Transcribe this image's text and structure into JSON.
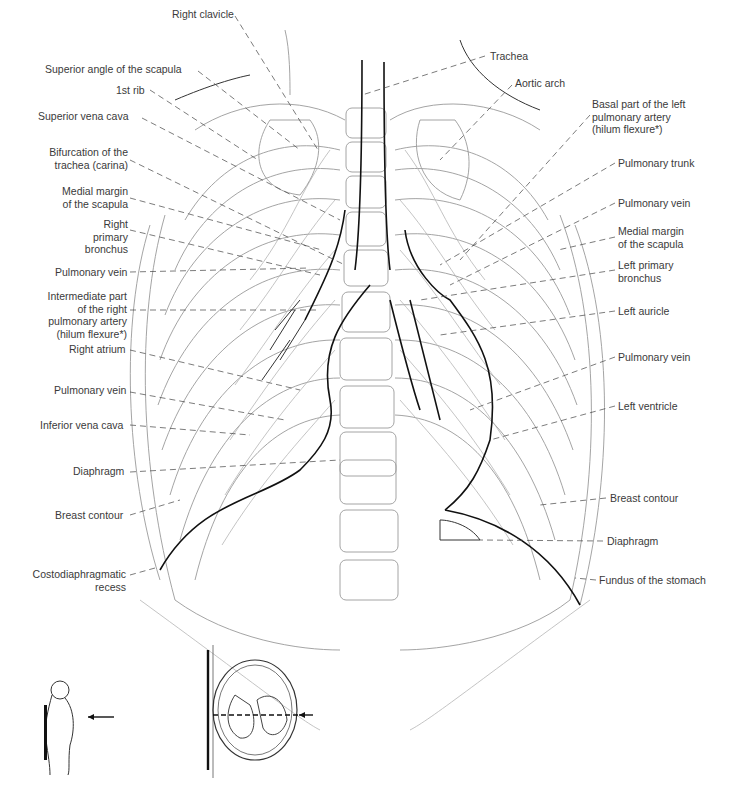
{
  "figure": {
    "labels_left": [
      {
        "id": "right-clavicle",
        "text": "Right clavicle",
        "x": 172,
        "y": 8
      },
      {
        "id": "superior-angle-scapula",
        "text": "Superior angle of the scapula",
        "x": 45,
        "y": 63
      },
      {
        "id": "first-rib",
        "text": "1st rib",
        "x": 116,
        "y": 84
      },
      {
        "id": "superior-vena-cava",
        "text": "Superior vena cava",
        "x": 38,
        "y": 110
      },
      {
        "id": "carina",
        "text": "Bifurcation of the\ntrachea (carina)",
        "x": 48,
        "y": 146
      },
      {
        "id": "medial-margin-scapula-right",
        "text": "Medial margin\nof the scapula",
        "x": 62,
        "y": 185
      },
      {
        "id": "right-primary-bronchus",
        "text": "Right primary\nbronchus",
        "x": 66,
        "y": 218
      },
      {
        "id": "pulmonary-vein-right-upper",
        "text": "Pulmonary vein",
        "x": 55,
        "y": 266
      },
      {
        "id": "intermediate-pa",
        "text": "Intermediate part\nof the right\npulmonary artery\n(hilum flexure*)",
        "x": 47,
        "y": 290
      },
      {
        "id": "right-atrium",
        "text": "Right atrium",
        "x": 69,
        "y": 343
      },
      {
        "id": "pulmonary-vein-right-lower",
        "text": "Pulmonary vein",
        "x": 54,
        "y": 384
      },
      {
        "id": "inferior-vena-cava",
        "text": "Inferior vena cava",
        "x": 40,
        "y": 419
      },
      {
        "id": "diaphragm-right",
        "text": "Diaphragm",
        "x": 73,
        "y": 465
      },
      {
        "id": "breast-contour-right",
        "text": "Breast contour",
        "x": 55,
        "y": 509
      },
      {
        "id": "costodiaphragmatic-recess",
        "text": "Costodiaphragmatic\nrecess",
        "x": 30,
        "y": 568
      }
    ],
    "labels_right": [
      {
        "id": "trachea",
        "text": "Trachea",
        "x": 490,
        "y": 50
      },
      {
        "id": "aortic-arch",
        "text": "Aortic arch",
        "x": 515,
        "y": 77
      },
      {
        "id": "basal-left-pa",
        "text": "Basal part of the left\npulmonary artery\n(hilum flexure*)",
        "x": 592,
        "y": 98
      },
      {
        "id": "pulmonary-trunk",
        "text": "Pulmonary trunk",
        "x": 618,
        "y": 157
      },
      {
        "id": "pulmonary-vein-left-upper",
        "text": "Pulmonary vein",
        "x": 618,
        "y": 197
      },
      {
        "id": "medial-margin-scapula-left",
        "text": "Medial margin\nof the scapula",
        "x": 618,
        "y": 225
      },
      {
        "id": "left-primary-bronchus",
        "text": "Left primary\nbronchus",
        "x": 618,
        "y": 259
      },
      {
        "id": "left-auricle",
        "text": "Left auricle",
        "x": 618,
        "y": 305
      },
      {
        "id": "pulmonary-vein-left-lower",
        "text": "Pulmonary vein",
        "x": 618,
        "y": 351
      },
      {
        "id": "left-ventricle",
        "text": "Left ventricle",
        "x": 618,
        "y": 400
      },
      {
        "id": "breast-contour-left",
        "text": "Breast contour",
        "x": 610,
        "y": 492
      },
      {
        "id": "diaphragm-left",
        "text": "Diaphragm",
        "x": 607,
        "y": 535
      },
      {
        "id": "fundus-stomach",
        "text": "Fundus of the stomach",
        "x": 599,
        "y": 574
      }
    ],
    "orientation_icons": [
      {
        "id": "patient-side-view",
        "description": "Patient standing, X-ray beam from behind toward detector"
      },
      {
        "id": "axial-beam-diagram",
        "description": "Axial cross-section with dashed beam path"
      }
    ]
  }
}
